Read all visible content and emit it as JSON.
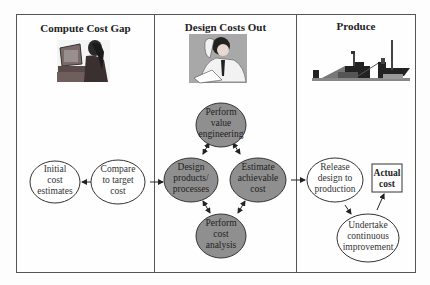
{
  "diagram": {
    "type": "flow-process",
    "colors": {
      "frame_border": "#555555",
      "light_node_fill": "#ffffff",
      "dark_node_fill": "#8f8f8f",
      "node_stroke": "#333333",
      "arrow": "#222222",
      "image_bg": "#a8a8a8"
    },
    "columns": [
      {
        "title": "Compute Cost Gap",
        "illustration": "person-at-computer",
        "nodes": [
          {
            "id": "initial",
            "lines": [
              "Initial",
              "cost",
              "estimates"
            ],
            "style": "light"
          },
          {
            "id": "compare",
            "lines": [
              "Compare",
              "to target",
              "cost"
            ],
            "style": "light"
          }
        ]
      },
      {
        "title": "Design Costs Out",
        "illustration": "engineer-reading-document",
        "nodes": [
          {
            "id": "value_eng",
            "lines": [
              "Perform",
              "value",
              "engineering"
            ],
            "style": "dark"
          },
          {
            "id": "design",
            "lines": [
              "Design",
              "products/",
              "processes"
            ],
            "style": "dark"
          },
          {
            "id": "estimate",
            "lines": [
              "Estimate",
              "achievable",
              "cost"
            ],
            "style": "dark"
          },
          {
            "id": "cost_analysis",
            "lines": [
              "Perform",
              "cost",
              "analysis"
            ],
            "style": "dark"
          }
        ]
      },
      {
        "title": "Produce",
        "illustration": "factory-silhouette",
        "nodes": [
          {
            "id": "release",
            "lines": [
              "Release",
              "design to",
              "production"
            ],
            "style": "light"
          },
          {
            "id": "improve",
            "lines": [
              "Undertake",
              "continuous",
              "improvement"
            ],
            "style": "light"
          },
          {
            "id": "actual",
            "lines": [
              "Actual",
              "cost"
            ],
            "style": "box-bold"
          }
        ]
      }
    ],
    "edges": [
      {
        "from": "compare",
        "to": "initial",
        "direction": "single"
      },
      {
        "from": "compare",
        "to": "design",
        "direction": "single"
      },
      {
        "from": "design",
        "to": "value_eng",
        "direction": "both"
      },
      {
        "from": "value_eng",
        "to": "estimate",
        "direction": "both"
      },
      {
        "from": "design",
        "to": "cost_analysis",
        "direction": "both"
      },
      {
        "from": "estimate",
        "to": "cost_analysis",
        "direction": "both"
      },
      {
        "from": "estimate",
        "to": "release",
        "direction": "single"
      },
      {
        "from": "release",
        "to": "improve",
        "direction": "single"
      },
      {
        "from": "improve",
        "to": "actual",
        "direction": "single"
      }
    ]
  }
}
